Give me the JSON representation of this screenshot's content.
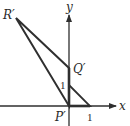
{
  "figure": {
    "axes": {
      "x_label": "x",
      "y_label": "y"
    },
    "points": {
      "origin": "P′",
      "q": "Q′",
      "r": "R′"
    },
    "unit_labels": {
      "y_unit": "1",
      "x_unit": "1"
    },
    "colors": {
      "line": "#2f2f2f",
      "background": "#ffffff"
    }
  }
}
